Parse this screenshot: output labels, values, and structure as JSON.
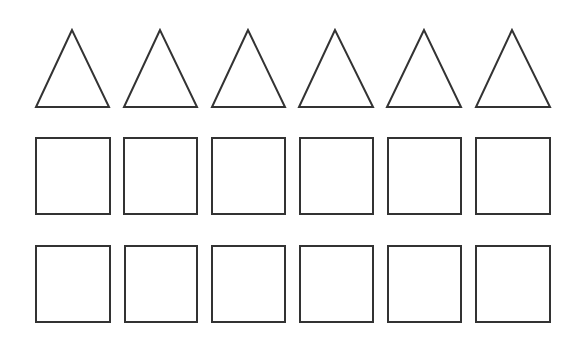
{
  "canvas": {
    "width": 582,
    "height": 342,
    "background": "#ffffff"
  },
  "style": {
    "stroke": "#333333",
    "stroke_width": 2
  },
  "rows": [
    {
      "shape": "triangle",
      "items": [
        {
          "points": "72,30 36,107 109,107"
        },
        {
          "points": "160,30 124,107 197,107"
        },
        {
          "points": "248,30 212,107 285,107"
        },
        {
          "points": "335,30 299,107 373,107"
        },
        {
          "points": "424,30 387,107 461,107"
        },
        {
          "points": "512,30 476,107 550,107"
        }
      ]
    },
    {
      "shape": "square",
      "items": [
        {
          "x": 36,
          "y": 138,
          "w": 74,
          "h": 76
        },
        {
          "x": 124,
          "y": 138,
          "w": 73,
          "h": 76
        },
        {
          "x": 212,
          "y": 138,
          "w": 73,
          "h": 76
        },
        {
          "x": 300,
          "y": 138,
          "w": 73,
          "h": 76
        },
        {
          "x": 388,
          "y": 138,
          "w": 73,
          "h": 76
        },
        {
          "x": 476,
          "y": 138,
          "w": 74,
          "h": 76
        }
      ]
    },
    {
      "shape": "square",
      "items": [
        {
          "x": 36,
          "y": 246,
          "w": 74,
          "h": 76
        },
        {
          "x": 125,
          "y": 246,
          "w": 72,
          "h": 76
        },
        {
          "x": 212,
          "y": 246,
          "w": 73,
          "h": 76
        },
        {
          "x": 300,
          "y": 246,
          "w": 73,
          "h": 76
        },
        {
          "x": 388,
          "y": 246,
          "w": 73,
          "h": 76
        },
        {
          "x": 476,
          "y": 246,
          "w": 74,
          "h": 76
        }
      ]
    }
  ]
}
